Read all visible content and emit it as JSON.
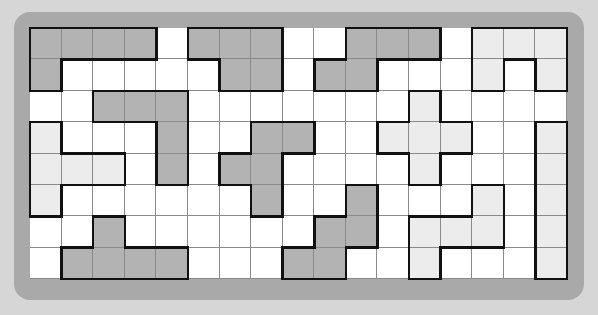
{
  "puzzle": {
    "type": "polyomino-grid",
    "columns": 17,
    "rows": 8,
    "colors": {
      "dark": "#b3b3b3",
      "light": "#ececec",
      "empty": "#ffffff",
      "frame": "#a9a9a9",
      "background": "#d6d6d6"
    },
    "fills": [
      "dddd.ddd..ddd.lll",
      "d.....dd.dd...l.l",
      "..ddd.......l....",
      "l...d..dd..lll..l",
      "lll.d.dd....l...l",
      "l......d..d...l.l",
      "..d......dd.lll.l",
      ".dddd...dd..l...l"
    ],
    "pieces": [
      "AAAA.BBB..CCC.DDD",
      "A.....BB.CC...D.D",
      "..FFF.......L....",
      "G...F..HH..LLL..M",
      "GGG.F.HH....L...M",
      "G......H..K...Q.M",
      "..J......KK.QQQ.M",
      ".JJJJ...KK..Q...M"
    ]
  }
}
